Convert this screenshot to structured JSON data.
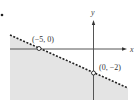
{
  "diagram": {
    "type": "linear-inequality-graph",
    "axes": {
      "x_label": "x",
      "y_label": "y"
    },
    "boundary": {
      "style": "dashed",
      "points": [
        "(−5, 0)",
        "(0, −2)"
      ]
    },
    "shaded_region": "below boundary line",
    "colors": {
      "shade": "#e4e4e4",
      "line": "#222222",
      "axis": "#555555"
    }
  },
  "labels": {
    "point_a": "(−5, 0)",
    "point_b": "(0, −2)",
    "x_axis": "x",
    "y_axis": "y"
  }
}
